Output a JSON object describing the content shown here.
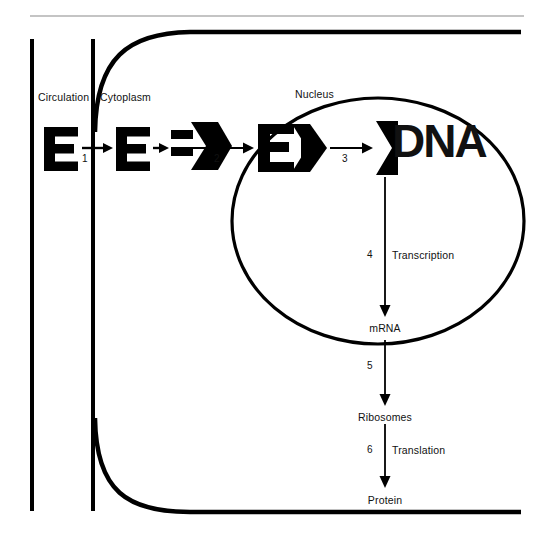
{
  "figure": {
    "background_color": "#ffffff",
    "ink_color": "#000000",
    "top_rule_color": "#b0b0b0"
  },
  "compartments": [
    {
      "id": "circulation",
      "label": "Circulation"
    },
    {
      "id": "cytoplasm",
      "label": "Cytoplasm"
    },
    {
      "id": "nucleus",
      "label": "Nucleus"
    }
  ],
  "molecules": [
    {
      "id": "hormone-circulation",
      "glyph": "E",
      "description": "free hormone in circulation"
    },
    {
      "id": "hormone-cytoplasm",
      "glyph": "E",
      "description": "free hormone in cytoplasm"
    },
    {
      "id": "hormone-receptor-cytoplasm",
      "glyph": "E",
      "description": "hormone bound to cytoplasmic receptor"
    },
    {
      "id": "hormone-receptor-nucleus",
      "glyph": "E",
      "description": "hormone receptor complex in nucleus"
    },
    {
      "id": "dna",
      "glyph": "DNA",
      "description": "hormone receptor complex bound to DNA"
    }
  ],
  "steps": [
    {
      "number": "1",
      "label": ""
    },
    {
      "number": "2",
      "label": ""
    },
    {
      "number": "3",
      "label": ""
    },
    {
      "number": "4",
      "label": "Transcription"
    },
    {
      "number": "5",
      "label": ""
    },
    {
      "number": "6",
      "label": "Translation"
    }
  ],
  "products": [
    {
      "id": "mrna",
      "label": "mRNA"
    },
    {
      "id": "ribosomes",
      "label": "Ribosomes"
    },
    {
      "id": "protein",
      "label": "Protein"
    }
  ]
}
